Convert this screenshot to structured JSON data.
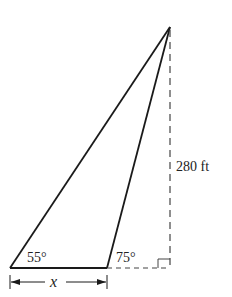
{
  "diagram": {
    "type": "trigonometry-triangle",
    "vertices": {
      "apex": [
        170,
        27
      ],
      "bottom_left": [
        10,
        268
      ],
      "bottom_middle": [
        107,
        268
      ],
      "foot_of_perpendicular": [
        170,
        268
      ]
    },
    "angles": {
      "left": "55°",
      "middle": "75°"
    },
    "height_label": "280 ft",
    "base_label": "x",
    "colors": {
      "line": "#1a1a1a",
      "dashed": "#444444",
      "text": "#222222"
    }
  }
}
